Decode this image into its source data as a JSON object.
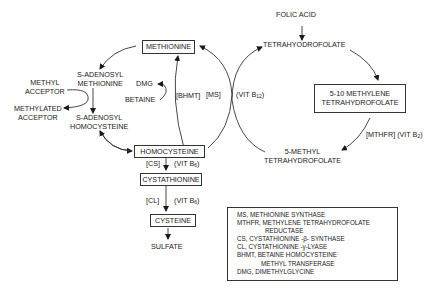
{
  "diagram": {
    "nodes": {
      "folic_acid": "FOLIC ACID",
      "tetrahydrofolate": "TETRAHYODROFOLATE",
      "methylene_thf_line1": "5-10 METHYLENE",
      "methylene_thf_line2": "TETRAHYDROFOLATE",
      "methyl_thf_line1": "5-METHYL",
      "methyl_thf_line2": "TETRAHYDROFOLATE",
      "methionine": "METHIONINE",
      "sam_line1": "S-ADENOSYL",
      "sam_line2": "METHIONINE",
      "sah_line1": "S-ADENOSYL",
      "sah_line2": "HOMOCYSTEINE",
      "methyl_acceptor_line1": "METHYL",
      "methyl_acceptor_line2": "ACCEPTOR",
      "methylated_acceptor_line1": "METHYLATED",
      "methylated_acceptor_line2": "ACCEPTOR",
      "dmg": "DMG",
      "betaine": "BETAINE",
      "homocysteine": "HOMOCYSTEINE",
      "cystathionine": "CYSTATHIONINE",
      "cysteine": "CYSTEINE",
      "sulfate": "SULFATE"
    },
    "enzymes": {
      "bhmt": "[BHMT]",
      "ms": "[MS]",
      "mthfr": "[MTHFR]",
      "cs": "[CS]",
      "cl": "[CL]"
    },
    "cofactors": {
      "ms_prefix": "(VIT B",
      "ms_sub": "12",
      "mthfr_prefix": "(VIT B",
      "mthfr_sub": "2",
      "cs_prefix": "(VIT B",
      "cs_sub": "6",
      "cl_prefix": "(VIT B",
      "cl_sub": "6",
      "suffix": ")"
    },
    "legend": [
      "MS, METHIONINE SYNTHASE",
      "MTHFR, METHYLENE TETRAHYDROFOLATE",
      "REDUCTASE",
      "CS, CYSTATHIONINE -β- SYNTHASE",
      "CL, CYSTATHIONINE -γ-LYASE",
      "BHMT, BETAINE HOMOCYSTEINE",
      "METHYL TRANSFERASE",
      "DMG, DIMETHYLGLYCINE"
    ]
  }
}
